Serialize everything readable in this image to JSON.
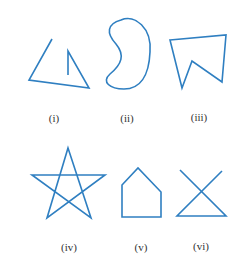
{
  "figure": {
    "stroke_color": "#2f7fc1",
    "label_color": "#333333",
    "shapes": [
      {
        "id": "i",
        "label": "(i)",
        "label_pos": [
          54,
          122
        ],
        "kind": "polyline",
        "points": "52,39 29,80 89,88 68,51 68,75"
      },
      {
        "id": "ii",
        "label": "(ii)",
        "label_pos": [
          127,
          122
        ],
        "kind": "path",
        "d": "M 121,20 C 135,14 152,28 150,52 C 149,76 140,89 124,89 C 110,89 101,82 110,74 C 122,64 125,55 116,44 C 106,33 107,24 121,20 Z"
      },
      {
        "id": "iii",
        "label": "(iii)",
        "label_pos": [
          199,
          121
        ],
        "kind": "polygon",
        "points": "170,40 226,35 222,82 192,61 182,88"
      },
      {
        "id": "iv",
        "label": "(iv)",
        "label_pos": [
          69,
          251
        ],
        "kind": "polygon",
        "points": "68,148 91,218 32,175 105,175 47,218"
      },
      {
        "id": "v",
        "label": "(v)",
        "label_pos": [
          141,
          251
        ],
        "kind": "polygon",
        "points": "122,185 138,168 161,192 161,217 122,217"
      },
      {
        "id": "vi",
        "label": "(vi)",
        "label_pos": [
          201,
          250
        ],
        "kind": "polyline",
        "points": "180,170 226,216 177,216 222,171"
      }
    ]
  }
}
